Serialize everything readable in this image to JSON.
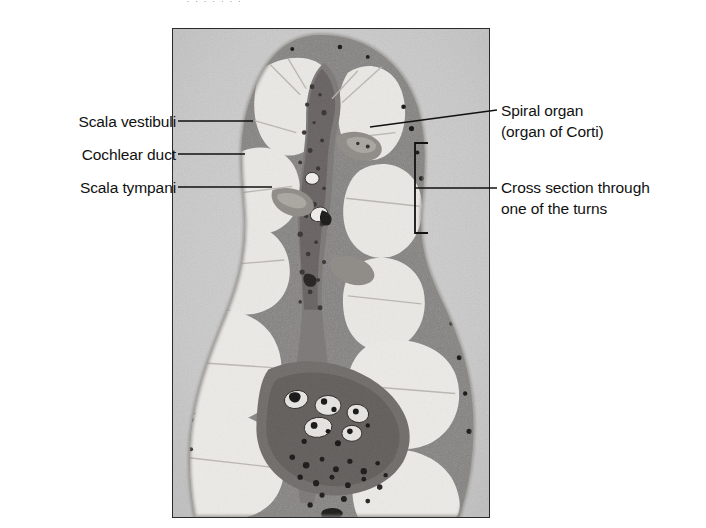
{
  "figure": {
    "top_cut_text": "·       ·    ·       ·      ·        ·  ·",
    "panel": {
      "background_color": "#cbcbcb",
      "tissue_color": "#7d7d7d",
      "lumen_color": "#ececec",
      "border_color": "#2a2a2a"
    }
  },
  "labels": {
    "left": [
      {
        "id": "scala-vestibuli",
        "text": "Scala vestibuli"
      },
      {
        "id": "cochlear-duct",
        "text": "Cochlear duct"
      },
      {
        "id": "scala-tympani",
        "text": "Scala tympani"
      }
    ],
    "right": [
      {
        "id": "spiral-organ",
        "line1": "Spiral organ",
        "line2": "(organ of Corti)"
      },
      {
        "id": "cross-section",
        "line1": "Cross section through",
        "line2": "one of the turns"
      }
    ]
  }
}
